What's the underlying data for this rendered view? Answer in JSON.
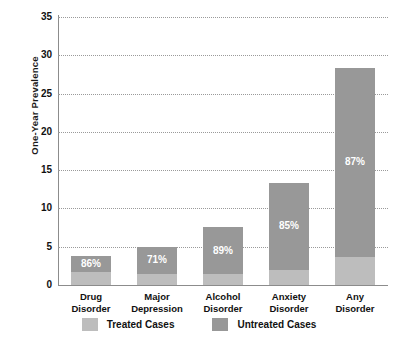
{
  "chart_data": {
    "type": "bar",
    "subtype": "stacked-bar",
    "title": "",
    "xlabel": "",
    "ylabel": "One-Year Prevalence",
    "ylim": [
      0,
      35
    ],
    "ytick_step": 5,
    "yticks": [
      35,
      30,
      25,
      20,
      15,
      10,
      5,
      0
    ],
    "grid": true,
    "grid_style": "dotted-horizontal",
    "legend_position": "bottom-center",
    "categories": [
      "Drug Disorder",
      "Major Depression",
      "Alcohol Disorder",
      "Anxiety Disorder",
      "Any Disorder"
    ],
    "category_lines": [
      [
        "Drug",
        "Disorder"
      ],
      [
        "Major",
        "Depression"
      ],
      [
        "Alcohol",
        "Disorder"
      ],
      [
        "Anxiety",
        "Disorder"
      ],
      [
        "Any",
        "Disorder"
      ]
    ],
    "series": [
      {
        "name": "Treated Cases",
        "color": "#bdbdbd",
        "values": [
          1.7,
          1.5,
          1.4,
          2.0,
          3.7
        ]
      },
      {
        "name": "Untreated Cases",
        "color": "#989898",
        "values": [
          2.1,
          3.5,
          6.2,
          11.3,
          24.6
        ]
      }
    ],
    "totals": [
      3.8,
      5.0,
      7.6,
      13.3,
      28.3
    ],
    "data_labels": [
      "86%",
      "71%",
      "89%",
      "85%",
      "87%"
    ],
    "data_label_meaning": "percent of cases untreated"
  },
  "axis": {
    "y_title": "One-Year Prevalence",
    "y_tick_labels": [
      "35",
      "30",
      "25",
      "20",
      "15",
      "10",
      "5",
      "0"
    ]
  },
  "legend": {
    "items": [
      {
        "label": "Treated Cases",
        "swatch": "treated",
        "color": "#bdbdbd"
      },
      {
        "label": "Untreated Cases",
        "swatch": "untreated",
        "color": "#989898"
      }
    ]
  },
  "colors": {
    "treated": "#bdbdbd",
    "untreated": "#989898",
    "axis": "#8c8c8c",
    "grid": "#9a9a9a",
    "text": "#111111",
    "background": "#ffffff",
    "data_label_text": "#ffffff"
  }
}
